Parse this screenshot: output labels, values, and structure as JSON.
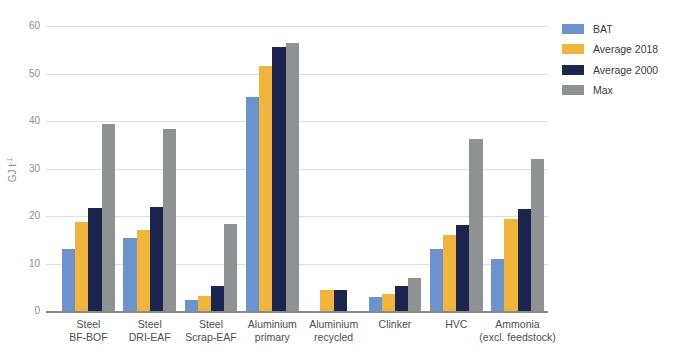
{
  "figure": {
    "background": "#ffffff"
  },
  "chart_data": {
    "type": "bar",
    "title": "",
    "xlabel": "",
    "ylabel": "GJ t⁻¹",
    "ylabel_base": "GJ t",
    "ylabel_exponent": "-1",
    "ylim": [
      0,
      60
    ],
    "yticks": [
      0,
      10,
      20,
      30,
      40,
      50,
      60
    ],
    "grid": "horizontal-gridlines-on",
    "legend_position": "top-right",
    "categories": [
      {
        "line1": "Steel",
        "line2": "BF-BOF"
      },
      {
        "line1": "Steel",
        "line2": "DRI-EAF"
      },
      {
        "line1": "Steel",
        "line2": "Scrap-EAF"
      },
      {
        "line1": "Aluminium",
        "line2": "primary"
      },
      {
        "line1": "Aluminium",
        "line2": "recycled"
      },
      {
        "line1": "Clinker",
        "line2": ""
      },
      {
        "line1": "HVC",
        "line2": ""
      },
      {
        "line1": "Ammonia",
        "line2": "(excl. feedstock)"
      }
    ],
    "series": [
      {
        "name": "BAT",
        "color": "#6B94CE",
        "values": [
          13.1,
          15.4,
          2.4,
          45.1,
          0,
          3.0,
          13.0,
          11.0
        ]
      },
      {
        "name": "Average 2018",
        "color": "#F2B53C",
        "values": [
          18.8,
          17.0,
          3.1,
          51.5,
          4.5,
          3.5,
          15.9,
          19.4
        ]
      },
      {
        "name": "Average 2000",
        "color": "#1B2550",
        "values": [
          21.6,
          21.9,
          5.3,
          55.5,
          4.5,
          5.2,
          18.1,
          21.5
        ]
      },
      {
        "name": "Max",
        "color": "#8F9193",
        "values": [
          39.4,
          38.3,
          18.3,
          56.4,
          0,
          6.9,
          36.2,
          31.9
        ]
      }
    ]
  },
  "style_colors": {
    "gridline": "#dedede",
    "axis_line": "#8a8a8a",
    "tick_text": "#8c8c8c",
    "category_text": "#4d4d4d",
    "legend_text": "#3a3a3a"
  }
}
